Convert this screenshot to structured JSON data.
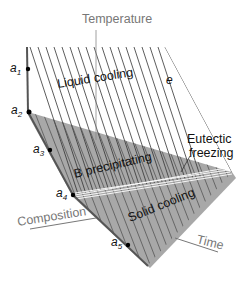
{
  "diagram": {
    "axis_labels": {
      "temperature": "Temperature",
      "composition": "Composition",
      "time": "Time"
    },
    "region_labels": {
      "liquid_cooling": "Liquid cooling",
      "b_precipitating": "B precipitating",
      "solid_cooling": "Solid cooling",
      "eutectic_line1": "Eutectic",
      "eutectic_line2": "freezing"
    },
    "points": {
      "a1": "a",
      "a1_sub": "1",
      "a2": "a",
      "a2_sub": "2",
      "a3": "a",
      "a3_sub": "3",
      "a4": "a",
      "a4_sub": "4",
      "a5": "a",
      "a5_sub": "5",
      "e": "e"
    },
    "colors": {
      "shaded": "#a6a6a6",
      "line": "#333333",
      "axis": "#666666",
      "label_gray": "#777777"
    }
  }
}
